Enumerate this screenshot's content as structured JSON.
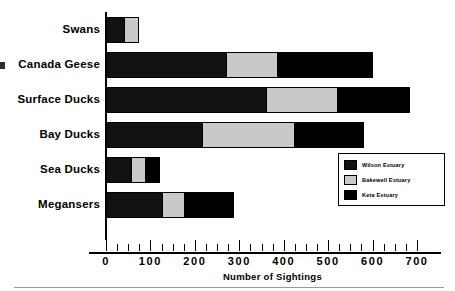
{
  "chart_data": {
    "type": "bar",
    "orientation": "horizontal",
    "stacked": true,
    "title": "",
    "subtitle": "",
    "xlabel": "Number of Sightings",
    "ylabel": "",
    "xlim": [
      0,
      700
    ],
    "xticks": [
      0,
      100,
      200,
      300,
      400,
      500,
      600,
      700
    ],
    "xtick_labels": [
      "0",
      "100",
      "200",
      "300",
      "400",
      "500",
      "600",
      "700"
    ],
    "minor_tick_interval": 25,
    "grid": false,
    "legend_position": "center-right",
    "categories": [
      "Swans",
      "Canada Geese",
      "Surface Ducks",
      "Bay Ducks",
      "Sea Ducks",
      "Megansers"
    ],
    "series": [
      {
        "name": "Wilson Estuary",
        "color": "#111111",
        "values": [
          40,
          270,
          360,
          215,
          55,
          125
        ]
      },
      {
        "name": "Bakewell Estuary",
        "color": "#c9c9c9",
        "values": [
          35,
          115,
          160,
          210,
          33,
          50
        ]
      },
      {
        "name": "Keta Estuary",
        "color": "#000000",
        "values": [
          0,
          215,
          165,
          155,
          34,
          113
        ]
      }
    ],
    "totals": [
      75,
      600,
      685,
      580,
      122,
      288
    ]
  },
  "legend": {
    "entries": [
      {
        "label": "Wilson Estuary",
        "swatch": "#111111"
      },
      {
        "label": "Bakewell Estuary",
        "swatch": "#c9c9c9"
      },
      {
        "label": "Keta Estuary",
        "swatch": "#000000"
      }
    ]
  },
  "axis": {
    "x_title": "Number of Sightings",
    "tick_labels": [
      "0",
      "100",
      "200",
      "300",
      "400",
      "500",
      "600",
      "700"
    ]
  },
  "categories": [
    "Swans",
    "Canada Geese",
    "Surface Ducks",
    "Bay Ducks",
    "Sea Ducks",
    "Megansers"
  ]
}
